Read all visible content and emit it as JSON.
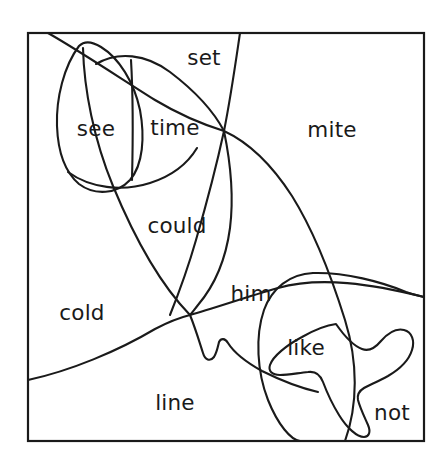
{
  "figure": {
    "background_color": "#ffffff",
    "stroke_color": "#1a1a1a",
    "frame": {
      "x": 28,
      "y": 33,
      "width": 396,
      "height": 408
    }
  },
  "labels": [
    {
      "id": "set",
      "text": "set",
      "x": 204,
      "y": 65
    },
    {
      "id": "see",
      "text": "see",
      "x": 96,
      "y": 136
    },
    {
      "id": "time",
      "text": "time",
      "x": 175,
      "y": 135
    },
    {
      "id": "mite",
      "text": "mite",
      "x": 332,
      "y": 137
    },
    {
      "id": "could",
      "text": "could",
      "x": 177,
      "y": 233
    },
    {
      "id": "him",
      "text": "him",
      "x": 251,
      "y": 301
    },
    {
      "id": "cold",
      "text": "cold",
      "x": 82,
      "y": 320
    },
    {
      "id": "like",
      "text": "like",
      "x": 306,
      "y": 355
    },
    {
      "id": "line",
      "text": "line",
      "x": 175,
      "y": 410
    },
    {
      "id": "not",
      "text": "not",
      "x": 392,
      "y": 420
    }
  ],
  "curves": [
    {
      "id": "top-left-diagonal",
      "description": "line entering top edge near x=48 descending right through crossing to lower right exit at bottom edge"
    },
    {
      "id": "steep-top-curve",
      "description": "curve entering top edge near x=240 bending left and down to central junction"
    },
    {
      "id": "see-oval",
      "description": "small oval enclosing the word see in upper left"
    },
    {
      "id": "could-lens",
      "description": "large leaf shape enclosing the word could"
    },
    {
      "id": "broad-arc",
      "description": "wide arc sweeping from left edge upward to the right"
    },
    {
      "id": "like-oval",
      "description": "large oval enclosing the word like"
    },
    {
      "id": "starfish-blob",
      "description": "three lobed blob in the lower right near not"
    },
    {
      "id": "small-notch",
      "description": "small hook notch below the central junction"
    }
  ]
}
